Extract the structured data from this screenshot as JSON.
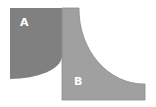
{
  "diagram": {
    "regions": [
      {
        "id": "A",
        "label": "A",
        "color": "#7f7f7f"
      },
      {
        "id": "B",
        "label": "B",
        "color": "#9a9a9a"
      }
    ],
    "border_color": "#8a8a8a"
  }
}
